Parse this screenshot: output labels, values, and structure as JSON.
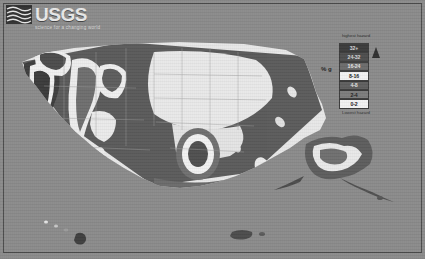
{
  "header": {
    "agency_name": "USGS",
    "tagline": "science for a changing world",
    "logo_icon": "usgs-wave-mark-icon"
  },
  "legend": {
    "axis_label": "% g",
    "top_label": "highest hazard",
    "bottom_label": "Lowest hazard",
    "arrow_icon": "up-arrow-icon",
    "bands": [
      {
        "label": "32+",
        "color": "#3a3a3a",
        "text_color": "#d9d9d9"
      },
      {
        "label": "24-32",
        "color": "#4c4c4c",
        "text_color": "#d9d9d9"
      },
      {
        "label": "16-24",
        "color": "#6a6a6a",
        "text_color": "#e6e6e6"
      },
      {
        "label": "8-16",
        "color": "#f2f2f2",
        "text_color": "#1a1a1a"
      },
      {
        "label": "4-8",
        "color": "#5e5e5e",
        "text_color": "#e0e0e0"
      },
      {
        "label": "2-4",
        "color": "#7c7c7c",
        "text_color": "#1f1f1f"
      },
      {
        "label": "0-2",
        "color": "#f2f2f2",
        "text_color": "#1a1a1a"
      }
    ]
  },
  "map": {
    "name": "national-seismic-hazard-map",
    "background_color": "#8a8a8a",
    "insets": [
      "alaska",
      "hawaii",
      "puerto-rico"
    ],
    "colors": {
      "low": "#e8e8e8",
      "mid_low": "#a6a6a6",
      "mid": "#7b7b7b",
      "mid_high": "#5a5a5a",
      "high": "#3c3c3c",
      "outline": "#9a9a9a"
    }
  }
}
